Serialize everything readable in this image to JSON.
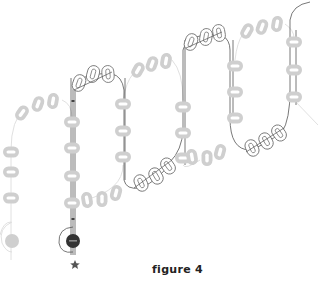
{
  "figure": {
    "caption": "figure 4",
    "colors": {
      "bead_fill": "#cfcfcf",
      "bead_hole": "#ffffff",
      "outline_bead_stroke": "#6a6a6a",
      "thread": "#555555",
      "thread_faint": "#d8d8d8",
      "dark_bead": "#333333",
      "star": "#555555"
    }
  },
  "diagram": {
    "shaded_vertical_beads": [
      {
        "x": 11,
        "y": 152
      },
      {
        "x": 11,
        "y": 172
      },
      {
        "x": 11,
        "y": 198
      },
      {
        "x": 72,
        "y": 122
      },
      {
        "x": 72,
        "y": 148
      },
      {
        "x": 72,
        "y": 176
      },
      {
        "x": 72,
        "y": 203
      },
      {
        "x": 123,
        "y": 104
      },
      {
        "x": 123,
        "y": 131
      },
      {
        "x": 123,
        "y": 157
      },
      {
        "x": 183,
        "y": 107
      },
      {
        "x": 183,
        "y": 133
      },
      {
        "x": 183,
        "y": 158
      },
      {
        "x": 235,
        "y": 66
      },
      {
        "x": 235,
        "y": 92
      },
      {
        "x": 235,
        "y": 118
      },
      {
        "x": 294,
        "y": 42
      },
      {
        "x": 294,
        "y": 70
      },
      {
        "x": 294,
        "y": 97
      }
    ],
    "shaded_angled_beads": [
      {
        "x": 22,
        "y": 113,
        "r": 35
      },
      {
        "x": 38,
        "y": 104,
        "r": 20
      },
      {
        "x": 53,
        "y": 101,
        "r": 10
      },
      {
        "x": 138,
        "y": 70,
        "r": 30
      },
      {
        "x": 150,
        "y": 64,
        "r": 20
      },
      {
        "x": 164,
        "y": 61,
        "r": 10
      },
      {
        "x": 247,
        "y": 31,
        "r": 30
      },
      {
        "x": 262,
        "y": 27,
        "r": 20
      },
      {
        "x": 277,
        "y": 24,
        "r": 10
      },
      {
        "x": 87,
        "y": 200,
        "r": -10
      },
      {
        "x": 102,
        "y": 199,
        "r": 0
      },
      {
        "x": 116,
        "y": 193,
        "r": 15
      },
      {
        "x": 192,
        "y": 157,
        "r": -10
      },
      {
        "x": 207,
        "y": 158,
        "r": 0
      },
      {
        "x": 220,
        "y": 152,
        "r": 15
      }
    ],
    "outline_beads": [
      {
        "x": 79,
        "y": 83,
        "r": 20
      },
      {
        "x": 93,
        "y": 73,
        "r": 15
      },
      {
        "x": 108,
        "y": 74,
        "r": -5
      },
      {
        "x": 191,
        "y": 42,
        "r": 20
      },
      {
        "x": 206,
        "y": 37,
        "r": 10
      },
      {
        "x": 219,
        "y": 33,
        "r": -10
      },
      {
        "x": 141,
        "y": 183,
        "r": -25
      },
      {
        "x": 156,
        "y": 176,
        "r": -30
      },
      {
        "x": 167,
        "y": 165,
        "r": -35
      },
      {
        "x": 252,
        "y": 148,
        "r": -25
      },
      {
        "x": 266,
        "y": 141,
        "r": -30
      },
      {
        "x": 279,
        "y": 133,
        "r": -35
      }
    ],
    "end_markers": {
      "light_bead": {
        "x": 12,
        "y": 241
      },
      "dark_bead": {
        "x": 73,
        "y": 241
      },
      "star": {
        "x": 75,
        "y": 265
      }
    }
  }
}
